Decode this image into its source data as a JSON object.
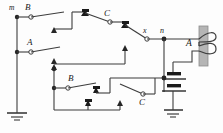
{
  "diagram": {
    "type": "electrical-schematic",
    "background_color": "#fdfdfd",
    "wire_color": "#3d3d3d",
    "label_color": "#1a1a1a",
    "core_color": "#b5b5b5",
    "labels": {
      "terminal_m": "m",
      "switch_b_top": "B",
      "switch_c_top": "C",
      "terminal_x": "x",
      "terminal_n": "n",
      "coil_a": "A",
      "switch_a_left": "A",
      "switch_b_bottom": "B",
      "switch_c_bottom": "C"
    },
    "components": {
      "coil": {
        "name": "A",
        "turns": 2
      },
      "battery": {
        "cells": 2
      },
      "ground_left": {
        "bars": 3
      },
      "ground_right": {
        "bars": 3
      },
      "switches": [
        "B",
        "A",
        "C",
        "B",
        "C"
      ],
      "terminals": [
        "m",
        "x",
        "n"
      ]
    }
  }
}
